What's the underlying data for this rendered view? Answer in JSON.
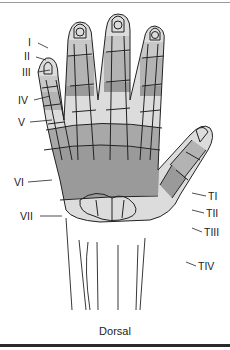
{
  "figure": {
    "caption": "Dorsal",
    "view": "Dorsal hand zones",
    "colors": {
      "dark_zone": "#9a9a9a",
      "mid_zone": "#bdbdbd",
      "light_zone": "#dcdcdc",
      "outline": "#222222",
      "background": "#ffffff"
    },
    "finger_zone_labels": [
      {
        "label": "I",
        "zone": "Zone I"
      },
      {
        "label": "II",
        "zone": "Zone II"
      },
      {
        "label": "III",
        "zone": "Zone III"
      },
      {
        "label": "IV",
        "zone": "Zone IV"
      },
      {
        "label": "V",
        "zone": "Zone V"
      },
      {
        "label": "VI",
        "zone": "Zone VI"
      },
      {
        "label": "VII",
        "zone": "Zone VII"
      }
    ],
    "thumb_zone_labels": [
      {
        "label": "TI",
        "zone": "Thumb Zone I"
      },
      {
        "label": "TII",
        "zone": "Thumb Zone II"
      },
      {
        "label": "TIII",
        "zone": "Thumb Zone III"
      },
      {
        "label": "TIV",
        "zone": "Thumb Zone IV"
      }
    ]
  }
}
